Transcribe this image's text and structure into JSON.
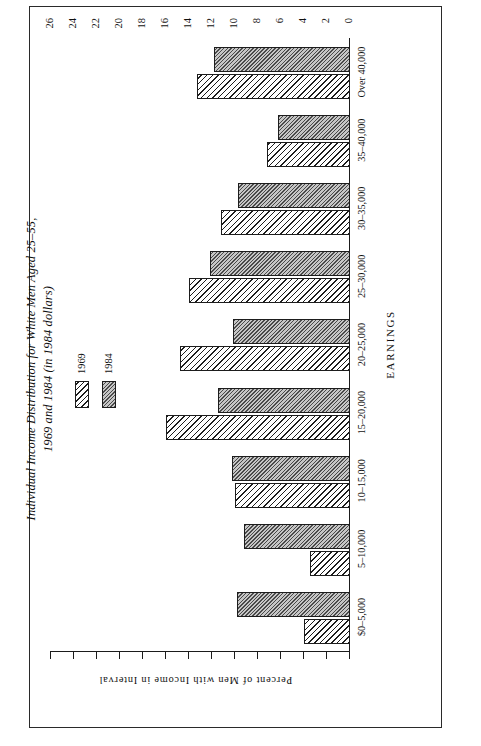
{
  "figure": {
    "title": "Individual Income Distribution for White Men Aged 25–55,\n1969 and 1984 (in 1984 dollars)",
    "source_note": "SOURCES:  1970 Census of Population and March 1985 Current Population Survey."
  },
  "legend": {
    "items": [
      {
        "label": "1969",
        "swatch": "diagonal-hatch"
      },
      {
        "label": "1984",
        "swatch": "solid-grey-hatch"
      }
    ]
  },
  "chart_data": {
    "type": "bar",
    "title": "Individual Income Distribution for White Men Aged 25–55, 1969 and 1984 (in 1984 dollars)",
    "xlabel": "EARNINGS",
    "ylabel": "Percent of Men with Income in Interval",
    "ylim": [
      0,
      26
    ],
    "yticks": [
      0,
      2,
      4,
      6,
      8,
      10,
      12,
      14,
      16,
      18,
      20,
      22,
      24,
      26
    ],
    "grid": false,
    "legend_position": "upper-center",
    "orientation": "horizontal-rotated-page",
    "categories": [
      "$0–5,000",
      "5–10,000",
      "10–15,000",
      "15–20,000",
      "20–25,000",
      "25–30,000",
      "30–35,000",
      "35–40,000",
      "Over 40,000"
    ],
    "series": [
      {
        "name": "1969",
        "values": [
          4.0,
          3.5,
          10.0,
          16.0,
          14.8,
          14.0,
          11.2,
          7.2,
          13.3
        ]
      },
      {
        "name": "1984",
        "values": [
          9.8,
          9.2,
          10.3,
          11.5,
          10.2,
          12.2,
          9.7,
          6.3,
          11.8
        ]
      }
    ]
  }
}
